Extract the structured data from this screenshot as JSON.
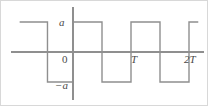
{
  "figure": {
    "name": "square-wave-plot",
    "background_color": "#ffffff",
    "line_color": "#8f8f8f",
    "label_color": "#4a4a4a",
    "border_color": "#d8d8d8"
  },
  "labels": {
    "amplitude_positive": "a",
    "origin": "0",
    "amplitude_negative": "−a",
    "period": "T",
    "two_periods": "2T"
  },
  "chart_data": {
    "type": "line",
    "title": "",
    "xlabel": "",
    "ylabel": "",
    "grid": false,
    "legend": null,
    "xlim": [
      -0.92,
      1.42
    ],
    "ylim": [
      -1.55,
      1.55
    ],
    "y_ticks": [
      {
        "value": 1,
        "label": "a"
      },
      {
        "value": 0,
        "label": "0"
      },
      {
        "value": -1,
        "label": "−a"
      }
    ],
    "x_ticks": [
      {
        "value": 0,
        "label": "0"
      },
      {
        "value": 1,
        "label": "T"
      },
      {
        "value": 2,
        "label": "2T"
      }
    ],
    "amplitude": "a",
    "period": "T",
    "series": [
      {
        "name": "square-wave",
        "x": [
          -0.92,
          -0.44,
          -0.44,
          0.0,
          0.0,
          0.5,
          0.5,
          1.0,
          1.0,
          1.5,
          1.5,
          2.0,
          2.0,
          2.16
        ],
        "y": [
          1,
          1,
          -1,
          -1,
          1,
          1,
          -1,
          -1,
          1,
          1,
          -1,
          -1,
          1,
          1
        ]
      }
    ]
  },
  "geometry": {
    "x_axis_y": 51,
    "y_axis_x": 72,
    "top_level_y": 21,
    "bottom_level_y": 80,
    "wave_points": "18,21 45,21 45,80 72,80 72,21 101,21 101,80 128,80 128,21 156,21 156,80 184,80 184,21 193,21",
    "x_axis": {
      "x1": 10,
      "y1": 51,
      "x2": 203,
      "y2": 51
    },
    "y_axis": {
      "x1": 72,
      "y1": 6,
      "x2": 72,
      "y2": 99
    }
  }
}
